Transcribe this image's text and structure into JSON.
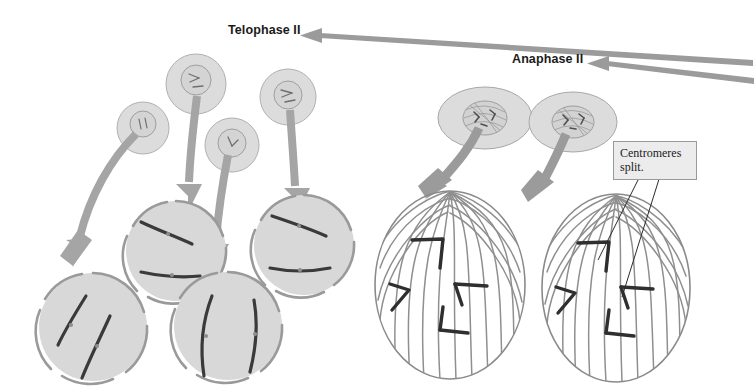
{
  "diagram": {
    "background_color": "#ffffff"
  },
  "labels": {
    "telophase": "Telophase II",
    "anaphase": "Anaphase II"
  },
  "callouts": {
    "centromeres": "Centromeres split."
  },
  "colors": {
    "cell_fill": "#d8d8d8",
    "cell_stroke": "#8f8f8f",
    "nucleus_fill": "#dedede",
    "chromosome_dark": "#3a3a3a",
    "chromosome_mid": "#6d6d6d",
    "spindle_fiber": "#8a8a8a",
    "arrow_gray": "#9b9b9b",
    "arrow_dark": "#8a8a8a",
    "callout_fill": "#ececed",
    "callout_border": "#9a9a9a",
    "leader_line": "#2b2b2b",
    "label_text": "#1a1a1a"
  },
  "structures": {
    "overview_cells": [
      {
        "name": "anaphase-overview-cell-1",
        "cx": 485,
        "cy": 118,
        "rx": 47,
        "ry": 31
      },
      {
        "name": "anaphase-overview-cell-2",
        "cx": 573,
        "cy": 122,
        "rx": 44,
        "ry": 30
      }
    ],
    "small_telophase_cells": [
      {
        "name": "telophase-small-cell-1",
        "cx": 143,
        "cy": 128,
        "r": 26
      },
      {
        "name": "telophase-small-cell-2",
        "cx": 196,
        "cy": 84,
        "r": 30
      },
      {
        "name": "telophase-small-cell-3",
        "cx": 232,
        "cy": 145,
        "r": 27
      },
      {
        "name": "telophase-small-cell-4",
        "cx": 288,
        "cy": 97,
        "r": 28
      }
    ],
    "telophase_cells": [
      {
        "name": "telophase-cell-upper-left",
        "cx": 176,
        "cy": 251,
        "r": 52
      },
      {
        "name": "telophase-cell-upper-right",
        "cx": 304,
        "cy": 245,
        "r": 52
      },
      {
        "name": "telophase-cell-lower-left",
        "cx": 93,
        "cy": 327,
        "r": 55
      },
      {
        "name": "telophase-cell-lower-right",
        "cx": 228,
        "cy": 326,
        "r": 55
      }
    ],
    "anaphase_cells": [
      {
        "name": "anaphase-cell-left",
        "cx": 450,
        "cy": 285,
        "rx": 75,
        "ry": 94
      },
      {
        "name": "anaphase-cell-right",
        "cx": 616,
        "cy": 288,
        "rx": 74,
        "ry": 94
      }
    ]
  },
  "flow": {
    "direction": "right-to-left",
    "steps": [
      "Anaphase II",
      "Telophase II"
    ]
  }
}
